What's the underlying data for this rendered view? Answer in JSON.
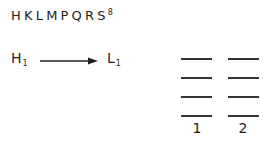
{
  "title": {
    "text": "HKLMPQRS",
    "superscript": "8"
  },
  "transition": {
    "from": {
      "symbol": "H",
      "subscript": "1"
    },
    "to": {
      "symbol": "L",
      "subscript": "1"
    },
    "arrow": "right-arrow"
  },
  "columns": [
    {
      "label": "1",
      "levels": 4
    },
    {
      "label": "2",
      "levels": 4
    }
  ],
  "colors": {
    "ink": "#1e1e1e",
    "lines": "#333333"
  }
}
